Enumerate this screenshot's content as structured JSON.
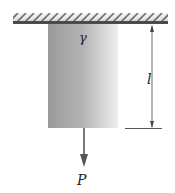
{
  "diagram": {
    "type": "hanging bar under self-weight and end load",
    "labels": {
      "specific_weight": "γ",
      "length": "l",
      "load": "P"
    },
    "colors": {
      "ceiling_dark": "#4a4a4a",
      "ceiling_light": "#b8b8b8",
      "bar_left": "#9c9c9c",
      "bar_right": "#eeeeee",
      "lines": "#444444"
    }
  }
}
